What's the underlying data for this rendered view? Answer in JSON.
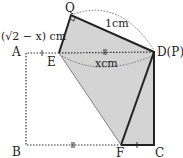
{
  "diagram": {
    "points": {
      "A": "A",
      "B": "B",
      "C": "C",
      "D": "D(P)",
      "E": "E",
      "F": "F",
      "Q": "Q"
    },
    "labels": {
      "eq_length": "(√2 − x) cm",
      "qd_length": "1cm",
      "ed_length": "xcm"
    },
    "colors": {
      "shade": "#d4d4d4",
      "line": "#222222"
    }
  }
}
